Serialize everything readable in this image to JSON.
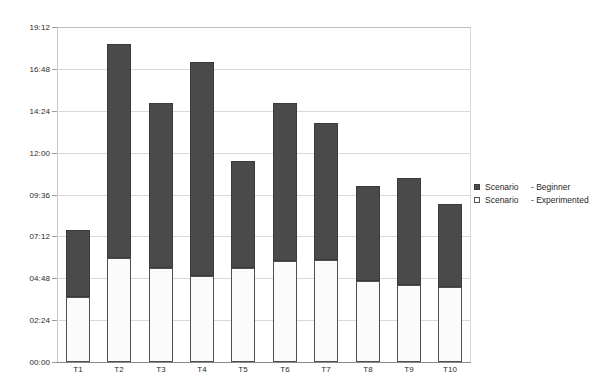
{
  "chart_data": {
    "type": "bar",
    "subtype": "stacked-vertical",
    "title": "",
    "xlabel": "",
    "ylabel": "",
    "categories": [
      "T1",
      "T2",
      "T3",
      "T4",
      "T5",
      "T6",
      "T7",
      "T8",
      "T9",
      "T10"
    ],
    "ylim": [
      "00:00",
      "19:12"
    ],
    "y_unit": "hh:mm",
    "y_tick_interval": "02:24",
    "yticks": [
      "00:00",
      "02:24",
      "04:48",
      "07:12",
      "09:36",
      "12:00",
      "14:24",
      "16:48",
      "19:12"
    ],
    "ytick_values_hours": [
      0,
      2.4,
      4.8,
      7.2,
      9.6,
      12.0,
      14.4,
      16.8,
      19.2
    ],
    "grid": true,
    "legend_position": "right",
    "series": [
      {
        "name": "Scenario  - Experimented",
        "color": "#ffffff",
        "stack_order": "bottom",
        "values": [
          "03:43",
          "05:58",
          "05:23",
          "04:56",
          "05:23",
          "05:47",
          "05:51",
          "04:38",
          "04:25",
          "04:18"
        ],
        "values_hours": [
          3.72,
          5.96,
          5.39,
          4.93,
          5.39,
          5.79,
          5.85,
          4.64,
          4.41,
          4.3
        ]
      },
      {
        "name": "Scenario  - Beginner",
        "color": "#4a4a4a",
        "stack_order": "top",
        "values": [
          "03:50",
          "12:15",
          "09:27",
          "12:15",
          "06:08",
          "09:04",
          "07:51",
          "05:27",
          "06:08",
          "04:45"
        ],
        "values_hours": [
          3.84,
          12.26,
          9.45,
          12.26,
          6.13,
          9.05,
          7.85,
          5.45,
          6.13,
          4.75
        ]
      }
    ],
    "totals": [
      "07:33",
      "18:13",
      "14:50",
      "17:11",
      "11:31",
      "14:50",
      "13:42",
      "10:05",
      "10:33",
      "09:03"
    ],
    "totals_hours": [
      7.56,
      18.22,
      14.84,
      17.19,
      11.52,
      14.84,
      13.7,
      10.09,
      10.54,
      9.05
    ]
  },
  "legend": {
    "entries": [
      {
        "name": "Scenario",
        "separator_label": "- Beginner",
        "swatch": "dark-square-icon"
      },
      {
        "name": "Scenario",
        "separator_label": "- Experimented",
        "swatch": "light-square-icon"
      }
    ]
  },
  "colors": {
    "series_beginner": "#4a4a4a",
    "series_experimented": "#ffffff",
    "gridline": "#d9d9d9",
    "axis": "#8a8a8a",
    "text": "#222222",
    "background": "#ffffff"
  }
}
